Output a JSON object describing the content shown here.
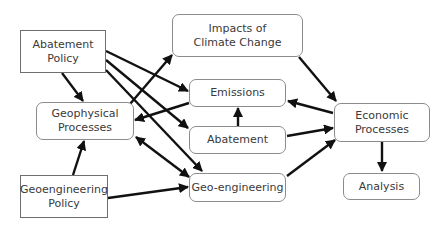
{
  "diagram": {
    "title": "",
    "nodes": [
      {
        "id": "abatement_policy",
        "label": "Abatement\nPolicy",
        "shape": "rectangle"
      },
      {
        "id": "impacts",
        "label": "Impacts of\nClimate Change",
        "shape": "rounded"
      },
      {
        "id": "emissions",
        "label": "Emissions",
        "shape": "rounded"
      },
      {
        "id": "geophysical",
        "label": "Geophysical\nProcesses",
        "shape": "rounded"
      },
      {
        "id": "abatement",
        "label": "Abatement",
        "shape": "rounded"
      },
      {
        "id": "economic",
        "label": "Economic\nProcesses",
        "shape": "rounded"
      },
      {
        "id": "geoengineering_policy",
        "label": "Geoengineering\nPolicy",
        "shape": "rectangle"
      },
      {
        "id": "geoengineering",
        "label": "Geo-engineering",
        "shape": "rounded"
      },
      {
        "id": "analysis",
        "label": "Analysis",
        "shape": "rounded"
      }
    ],
    "edges": [
      {
        "from": "abatement_policy",
        "to": "geophysical"
      },
      {
        "from": "abatement_policy",
        "to": "emissions"
      },
      {
        "from": "abatement_policy",
        "to": "abatement"
      },
      {
        "from": "abatement_policy",
        "to": "geoengineering"
      },
      {
        "from": "geophysical",
        "to": "impacts"
      },
      {
        "from": "emissions",
        "to": "geophysical"
      },
      {
        "from": "geophysical",
        "to": "geoengineering",
        "bidirectional": true
      },
      {
        "from": "impacts",
        "to": "economic"
      },
      {
        "from": "economic",
        "to": "emissions"
      },
      {
        "from": "abatement",
        "to": "emissions"
      },
      {
        "from": "abatement",
        "to": "economic"
      },
      {
        "from": "geoengineering",
        "to": "economic"
      },
      {
        "from": "economic",
        "to": "analysis"
      },
      {
        "from": "geoengineering_policy",
        "to": "geophysical"
      },
      {
        "from": "geoengineering_policy",
        "to": "geoengineering"
      }
    ]
  }
}
